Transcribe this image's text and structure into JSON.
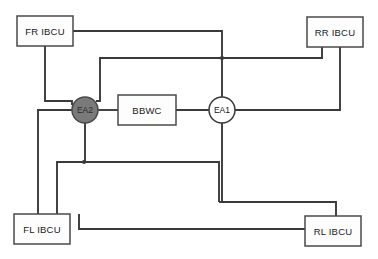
{
  "diagram": {
    "canvas": {
      "width": 378,
      "height": 259,
      "background": "#ffffff"
    },
    "colors": {
      "wire": "#3a3a3a",
      "box_fill": "#fdfdfd",
      "box_stroke": "#4a4a4a",
      "circle_open_fill": "#ffffff",
      "circle_filled_fill": "#7a7a7a",
      "label_text": "#1a1a1a"
    },
    "nodes": [
      {
        "id": "fr-ibcu",
        "label": "FR IBCU",
        "shape": "rectangle",
        "x": 17,
        "y": 16,
        "width": 56,
        "height": 30,
        "fill": "#fdfdfd"
      },
      {
        "id": "rr-ibcu",
        "label": "RR IBCU",
        "shape": "rectangle",
        "x": 307,
        "y": 17,
        "width": 56,
        "height": 30,
        "fill": "#fdfdfd"
      },
      {
        "id": "bbwc",
        "label": "BBWC",
        "shape": "rectangle",
        "x": 118,
        "y": 95,
        "width": 58,
        "height": 30,
        "fill": "#fdfdfd"
      },
      {
        "id": "fl-ibcu",
        "label": "FL IBCU",
        "shape": "rectangle",
        "x": 14,
        "y": 214,
        "width": 56,
        "height": 30,
        "fill": "#fdfdfd"
      },
      {
        "id": "rl-ibcu",
        "label": "RL IBCU",
        "shape": "rectangle",
        "x": 305,
        "y": 216,
        "width": 56,
        "height": 30,
        "fill": "#fdfdfd"
      },
      {
        "id": "ea2",
        "label": "EA2",
        "shape": "circle",
        "cx": 85,
        "cy": 110,
        "r": 13,
        "fill": "#7a7a7a",
        "filled": true
      },
      {
        "id": "ea1",
        "label": "EA1",
        "shape": "circle",
        "cx": 222,
        "cy": 110,
        "r": 13,
        "fill": "#ffffff",
        "filled": false
      }
    ],
    "links": [
      {
        "id": "fr-to-ea1-trunk",
        "from": "fr-ibcu",
        "to": "ea1"
      },
      {
        "id": "fr-to-ea2",
        "from": "fr-ibcu",
        "to": "ea2"
      },
      {
        "id": "ea2-to-bbwc",
        "from": "ea2",
        "to": "bbwc"
      },
      {
        "id": "bbwc-to-ea1",
        "from": "bbwc",
        "to": "ea1"
      },
      {
        "id": "ea2-to-rr",
        "from": "ea2",
        "to": "rr-ibcu"
      },
      {
        "id": "rr-to-ea1-bus",
        "from": "rr-ibcu",
        "to": "ea1"
      },
      {
        "id": "ea2-left-to-fl",
        "from": "ea2",
        "to": "fl-ibcu"
      },
      {
        "id": "ea2-down-to-fl",
        "from": "ea2",
        "to": "fl-ibcu"
      },
      {
        "id": "ea1-to-rl",
        "from": "ea1",
        "to": "rl-ibcu"
      },
      {
        "id": "fl-to-rl",
        "from": "fl-ibcu",
        "to": "rl-ibcu"
      },
      {
        "id": "mid-bus-to-fl",
        "from": "ea1",
        "to": "fl-ibcu"
      }
    ],
    "junctions": [
      {
        "id": "junction-top-bus",
        "x": 222,
        "y": 58
      },
      {
        "id": "junction-mid-bus",
        "x": 84,
        "y": 162
      }
    ]
  }
}
